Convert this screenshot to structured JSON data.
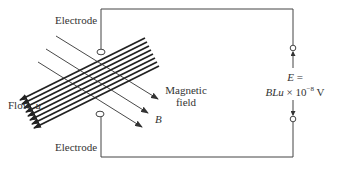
{
  "labels": {
    "electrode_top": "Electrode",
    "electrode_bottom": "Electrode",
    "flow_prefix": "Flow, ",
    "flow_var": "u",
    "magnetic_field_line1": "Magnetic",
    "magnetic_field_line2": "field",
    "field_var": "B",
    "emf_line1_var": "E",
    "emf_line1_eq": " =",
    "emf_line2_var": "BLu",
    "emf_line2_rest": " × 10",
    "emf_exponent": "−8",
    "emf_unit": " V"
  },
  "colors": {
    "stroke": "#333333",
    "background": "#ffffff"
  },
  "diagram": {
    "flow_line_count": 8,
    "field_line_count": 3
  }
}
